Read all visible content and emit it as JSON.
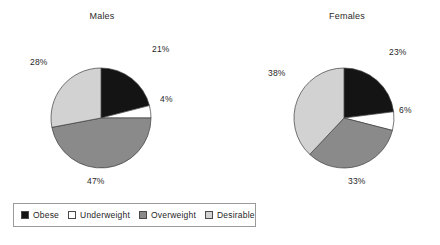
{
  "chart_data": [
    {
      "type": "pie",
      "title": "Males",
      "categories": [
        "Obese",
        "Underweight",
        "Overweight",
        "Desirable"
      ],
      "values": [
        21,
        47,
        28,
        4
      ],
      "slices": [
        {
          "label": "Obese",
          "value": 21,
          "display": "21%",
          "color": "#141414"
        },
        {
          "label": "Underweight",
          "value": 4,
          "display": "4%",
          "color": "#ffffff"
        },
        {
          "label": "Overweight",
          "value": 47,
          "display": "47%",
          "color": "#8a8a8a"
        },
        {
          "label": "Desirable",
          "value": 28,
          "display": "28%",
          "color": "#d2d2d2"
        }
      ],
      "start_angle": 0,
      "direction": "clockwise",
      "xlabel": "",
      "ylabel": ""
    },
    {
      "type": "pie",
      "title": "Females",
      "categories": [
        "Obese",
        "Underweight",
        "Overweight",
        "Desirable"
      ],
      "values": [
        23,
        33,
        38,
        6
      ],
      "slices": [
        {
          "label": "Obese",
          "value": 23,
          "display": "23%",
          "color": "#141414"
        },
        {
          "label": "Underweight",
          "value": 6,
          "display": "6%",
          "color": "#ffffff"
        },
        {
          "label": "Overweight",
          "value": 33,
          "display": "33%",
          "color": "#8a8a8a"
        },
        {
          "label": "Desirable",
          "value": 38,
          "display": "38%",
          "color": "#d2d2d2"
        }
      ],
      "start_angle": 0,
      "direction": "clockwise",
      "xlabel": "",
      "ylabel": ""
    }
  ],
  "charts": {
    "males": {
      "title": "Males",
      "labels": {
        "obese": "21%",
        "underweight": "4%",
        "overweight": "47%",
        "desirable": "28%"
      }
    },
    "females": {
      "title": "Females",
      "labels": {
        "obese": "23%",
        "underweight": "6%",
        "overweight": "33%",
        "desirable": "38%"
      }
    }
  },
  "legend": {
    "position": "bottom-left",
    "items": [
      {
        "label": "Obese",
        "color": "#141414"
      },
      {
        "label": "Underweight",
        "color": "#ffffff"
      },
      {
        "label": "Overweight",
        "color": "#8a8a8a"
      },
      {
        "label": "Desirable",
        "color": "#d2d2d2"
      }
    ]
  }
}
